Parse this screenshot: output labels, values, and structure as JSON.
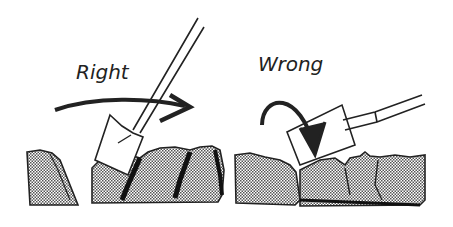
{
  "panels": [
    {
      "id": "right",
      "label": "Right"
    },
    {
      "id": "wrong",
      "label": "Wrong"
    }
  ],
  "colors": {
    "ink": "#222222",
    "soil": "#9a9a9a",
    "background": "#ffffff"
  }
}
